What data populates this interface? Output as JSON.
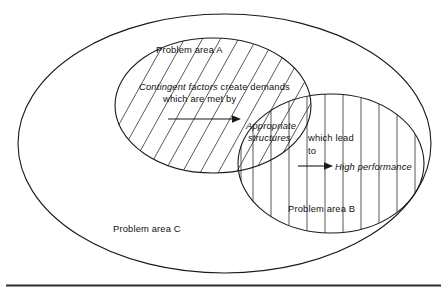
{
  "figure": {
    "type": "venn-diagram",
    "title": "",
    "background_color": "#ffffff",
    "line_color": "#1a1a1a"
  },
  "regions": {
    "outer": {
      "name": "Problem area C",
      "label": "Problem area C",
      "fill": "none",
      "hatch": "none"
    },
    "left": {
      "name": "Problem area A",
      "label": "Problem area A",
      "fill": "none",
      "hatch": "diagonal"
    },
    "right": {
      "name": "Problem area B",
      "label": "Problem area B",
      "fill": "none",
      "hatch": "vertical"
    }
  },
  "annotations": {
    "contingent_italic": "Contingent factors",
    "contingent_rest": " create demands",
    "contingent_line2": "which are met by",
    "structures_line1": "Appropriate",
    "structures_line2": "structures",
    "which_lead_line1": "which lead",
    "which_lead_line2": "to",
    "high_performance": "High performance"
  },
  "arrows": [
    {
      "name": "arrow-to-structures",
      "from_label": "Contingent factors create demands which are met by",
      "to_label": "Appropriate structures"
    },
    {
      "name": "arrow-to-performance",
      "from_label": "which lead to",
      "to_label": "High performance"
    }
  ]
}
